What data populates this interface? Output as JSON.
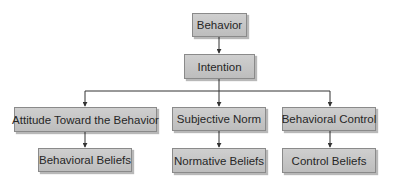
{
  "diagram": {
    "type": "hierarchy",
    "colors": {
      "node_fill": "#c6c6c6",
      "node_border": "#8a8a8a",
      "text": "#262626",
      "line": "#333333"
    },
    "nodes": {
      "behavior": {
        "label": "Behavior"
      },
      "intention": {
        "label": "Intention"
      },
      "attitude": {
        "label": "Attitude Toward the Behavior"
      },
      "subjective_norm": {
        "label": "Subjective Norm"
      },
      "behavioral_control": {
        "label": "Behavioral Control"
      },
      "behavioral_beliefs": {
        "label": "Behavioral Beliefs"
      },
      "normative_beliefs": {
        "label": "Normative Beliefs"
      },
      "control_beliefs": {
        "label": "Control Beliefs"
      }
    },
    "edges": [
      {
        "from": "behavior",
        "to": "intention"
      },
      {
        "from": "intention",
        "to": "attitude"
      },
      {
        "from": "intention",
        "to": "subjective_norm"
      },
      {
        "from": "intention",
        "to": "behavioral_control"
      },
      {
        "from": "attitude",
        "to": "behavioral_beliefs"
      },
      {
        "from": "subjective_norm",
        "to": "normative_beliefs"
      },
      {
        "from": "behavioral_control",
        "to": "control_beliefs"
      }
    ]
  }
}
